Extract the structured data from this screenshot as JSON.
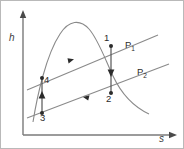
{
  "figure": {
    "type": "thermodynamic-h-s-diagram",
    "background_color": "#ffffff",
    "border_color": "#b9b9b9",
    "curve_color": "#8a8a8a",
    "process_color": "#555555",
    "text_color": "#2b2b2b"
  },
  "axes": {
    "y_label": "h",
    "x_label": "s",
    "y_axis_name": "enthalpy-axis",
    "x_axis_name": "entropy-axis"
  },
  "pressure_lines": [
    {
      "id": "P1",
      "label_main": "P",
      "label_sub": "1",
      "name": "high-pressure-line"
    },
    {
      "id": "P2",
      "label_main": "P",
      "label_sub": "2",
      "name": "low-pressure-line"
    }
  ],
  "state_points": [
    {
      "id": "1",
      "label": "1",
      "name": "state-point-1"
    },
    {
      "id": "2",
      "label": "2",
      "name": "state-point-2"
    },
    {
      "id": "3",
      "label": "3",
      "name": "state-point-3"
    },
    {
      "id": "4",
      "label": "4",
      "name": "state-point-4"
    }
  ],
  "processes": [
    {
      "id": "1-2",
      "direction": "downward",
      "name": "expansion-process-1-to-2"
    },
    {
      "id": "3-4",
      "direction": "upward",
      "name": "compression-process-3-to-4"
    },
    {
      "id": "4-1",
      "direction": "rightward",
      "name": "heat-addition-process-4-to-1"
    },
    {
      "id": "2-3",
      "direction": "leftward",
      "name": "heat-rejection-process-2-to-3"
    }
  ],
  "curves": [
    {
      "id": "saturation-dome",
      "name": "saturation-dome-curve"
    }
  ]
}
